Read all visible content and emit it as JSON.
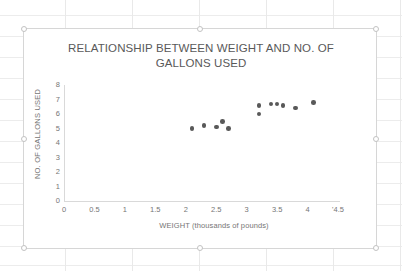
{
  "chart_data": {
    "type": "scatter",
    "title": "RELATIONSHIP BETWEEN WEIGHT AND NO. OF GALLONS USED",
    "title_line1": "RELATIONSHIP BETWEEN WEIGHT AND NO. OF",
    "title_line2": "GALLONS USED",
    "xlabel": "WEIGHT (thousands of pounds)",
    "ylabel": "NO. OF GALLONS USED",
    "xlim": [
      0,
      4.5
    ],
    "ylim": [
      0,
      8
    ],
    "grid": false,
    "legend": false,
    "marker_color": "#595959",
    "axis_color": "#d9d9d9",
    "x_ticks": [
      "0",
      "0.5",
      "1",
      "1.5",
      "2",
      "2.5",
      "3",
      "3.5",
      "4",
      "'4.5"
    ],
    "x_tick_values": [
      0,
      0.5,
      1,
      1.5,
      2,
      2.5,
      3,
      3.5,
      4,
      4.5
    ],
    "y_ticks": [
      "0",
      "1",
      "2",
      "3",
      "4",
      "5",
      "6",
      "7",
      "8"
    ],
    "y_tick_values": [
      0,
      1,
      2,
      3,
      4,
      5,
      6,
      7,
      8
    ],
    "series": [
      {
        "name": "Weight vs Gallons",
        "points": [
          {
            "x": 2.1,
            "y": 5.0
          },
          {
            "x": 2.3,
            "y": 5.2
          },
          {
            "x": 2.5,
            "y": 5.1
          },
          {
            "x": 2.6,
            "y": 5.5
          },
          {
            "x": 2.7,
            "y": 5.0
          },
          {
            "x": 3.2,
            "y": 6.6
          },
          {
            "x": 3.2,
            "y": 6.0
          },
          {
            "x": 3.4,
            "y": 6.7
          },
          {
            "x": 3.5,
            "y": 6.7
          },
          {
            "x": 3.6,
            "y": 6.6
          },
          {
            "x": 3.8,
            "y": 6.4
          },
          {
            "x": 4.1,
            "y": 6.8
          }
        ]
      }
    ]
  }
}
